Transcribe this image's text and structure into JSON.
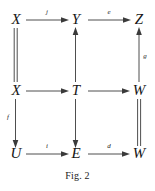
{
  "figure": {
    "caption": "Fig. 2",
    "type": "commutative-diagram"
  },
  "nodes": [
    {
      "id": "n-x-top",
      "label": "X",
      "col": 0,
      "row": 0
    },
    {
      "id": "n-y-top",
      "label": "Y",
      "col": 1,
      "row": 0
    },
    {
      "id": "n-z-top",
      "label": "Z",
      "col": 2,
      "row": 0
    },
    {
      "id": "n-x-middle",
      "label": "X",
      "col": 0,
      "row": 1
    },
    {
      "id": "n-t-middle",
      "label": "T",
      "col": 1,
      "row": 1
    },
    {
      "id": "n-w-middle",
      "label": "W",
      "col": 2,
      "row": 1
    },
    {
      "id": "n-u-bottom",
      "label": "U",
      "col": 0,
      "row": 2
    },
    {
      "id": "n-e-bottom",
      "label": "E",
      "col": 1,
      "row": 2
    },
    {
      "id": "n-w-bottom",
      "label": "W",
      "col": 2,
      "row": 2
    }
  ],
  "edges": [
    {
      "id": "e-x-to-y-top",
      "from": "X",
      "to": "Y",
      "label": "j",
      "style": "arrow",
      "direction": "right"
    },
    {
      "id": "e-y-to-z-top",
      "from": "Y",
      "to": "Z",
      "label": "e",
      "style": "arrow",
      "direction": "right"
    },
    {
      "id": "e-x-to-t-middle",
      "from": "X",
      "to": "T",
      "label": "",
      "style": "arrow",
      "direction": "right"
    },
    {
      "id": "e-t-to-w-middle",
      "from": "T",
      "to": "W",
      "label": "",
      "style": "arrow",
      "direction": "right"
    },
    {
      "id": "e-u-to-e-bottom",
      "from": "U",
      "to": "E",
      "label": "i",
      "style": "arrow",
      "direction": "right"
    },
    {
      "id": "e-e-to-w-bottom",
      "from": "E",
      "to": "W",
      "label": "d",
      "style": "arrow",
      "direction": "right"
    },
    {
      "id": "e-x-equals-x-left",
      "from": "X",
      "to": "X",
      "label": "",
      "style": "double",
      "direction": "none"
    },
    {
      "id": "e-t-to-y-middle",
      "from": "T",
      "to": "Y",
      "label": "",
      "style": "arrow",
      "direction": "up"
    },
    {
      "id": "e-w-to-z-right",
      "from": "W",
      "to": "Z",
      "label": "g",
      "style": "arrow",
      "direction": "up"
    },
    {
      "id": "e-x-to-u-left",
      "from": "X",
      "to": "U",
      "label": "f",
      "style": "arrow",
      "direction": "down"
    },
    {
      "id": "e-t-to-e-middle",
      "from": "T",
      "to": "E",
      "label": "",
      "style": "arrow",
      "direction": "down"
    },
    {
      "id": "e-w-equals-w-right",
      "from": "W",
      "to": "W",
      "label": "",
      "style": "double",
      "direction": "none"
    }
  ],
  "labels": {
    "node_x_top": "X",
    "node_y_top": "Y",
    "node_z_top": "Z",
    "node_x_middle": "X",
    "node_t_middle": "T",
    "node_w_middle": "W",
    "node_u_bottom": "U",
    "node_e_bottom": "E",
    "node_w_bottom": "W",
    "edge_j": "j",
    "edge_e": "e",
    "edge_g": "g",
    "edge_f": "f",
    "edge_i": "i",
    "edge_d": "d"
  },
  "colors": {
    "ink": "#161616",
    "stroke": "#3a3a3a",
    "background": "#ffffff"
  }
}
